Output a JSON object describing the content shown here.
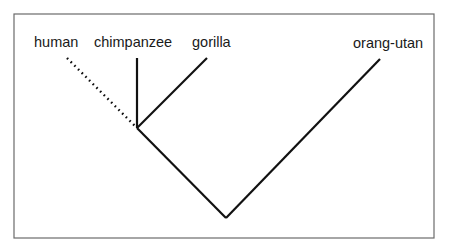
{
  "diagram": {
    "type": "phylogenetic-tree",
    "leaves": [
      {
        "id": "human",
        "label": "human",
        "line_style": "dotted"
      },
      {
        "id": "chimpanzee",
        "label": "chimpanzee",
        "line_style": "solid"
      },
      {
        "id": "gorilla",
        "label": "gorilla",
        "line_style": "solid"
      },
      {
        "id": "orang-utan",
        "label": "orang-utan",
        "line_style": "solid"
      }
    ],
    "colors": {
      "line": "#111111",
      "frame": "#6b6b6b",
      "text": "#1a1a1a",
      "background": "#ffffff"
    }
  }
}
